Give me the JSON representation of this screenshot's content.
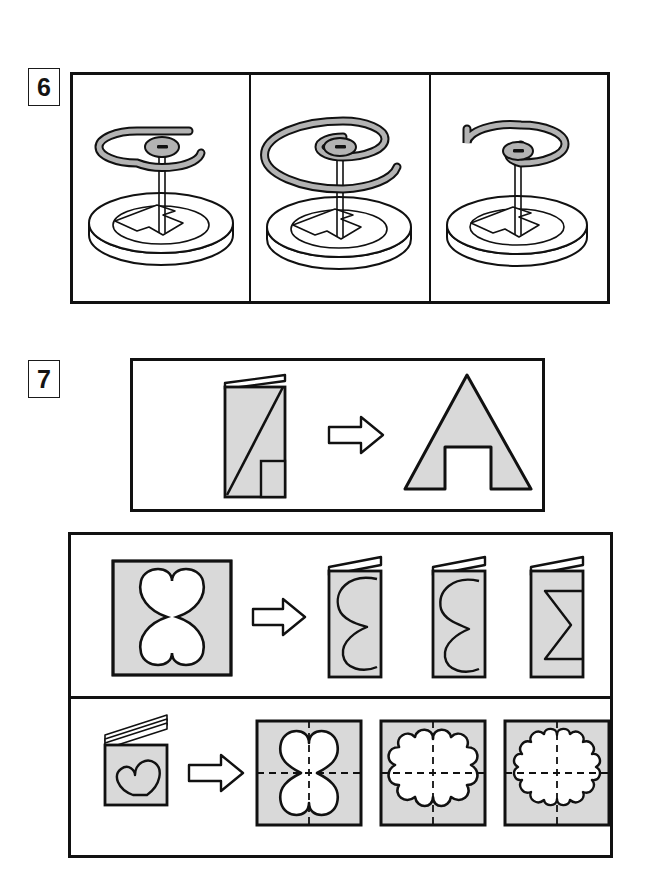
{
  "page": {
    "background_color": "#ffffff",
    "ink_color": "#111111",
    "fill_gray": "#d9d9d9",
    "coil_gray": "#b3b3b3"
  },
  "questions": [
    {
      "number": "6",
      "type": "pick-the-matching-coil",
      "description": "Three panels each showing a wire coil suspended above a round base plate with an arrow marking on it.",
      "panels": [
        {
          "id": "panel-1",
          "label": "A",
          "coil_turns": "1.25",
          "coil_size": "small",
          "coil_tail_direction": "right",
          "base": "round disc with arrow"
        },
        {
          "id": "panel-2",
          "label": "B",
          "coil_turns": "2.25",
          "coil_size": "large",
          "coil_tail_direction": "right-down",
          "base": "round disc with arrow"
        },
        {
          "id": "panel-3",
          "label": "C",
          "coil_turns": "1.75",
          "coil_size": "medium",
          "coil_tail_direction": "left-up",
          "base": "round disc with arrow"
        }
      ]
    },
    {
      "number": "7",
      "type": "paper-folding-and-cutting",
      "example": {
        "id": "example-row",
        "description": "Folded sheet with a diagonal cut and a small rectangular notch transforms into an A-shaped arch.",
        "input_label": "folded-sheet-with-diagonal-cut",
        "arrow": "right-arrow",
        "output_label": "arch-triangle-with-rectangular-notch"
      },
      "rows": [
        {
          "id": "row-butterfly",
          "description": "A square sheet with a four-petal butterfly hole, then three folded-sheet options.",
          "prompt_label": "square-with-four-petal-cutout",
          "arrow": "right-arrow",
          "options": [
            {
              "id": "option-1",
              "label": "folded-sheet-kidney-curve-a"
            },
            {
              "id": "option-2",
              "label": "folded-sheet-kidney-curve-b"
            },
            {
              "id": "option-3",
              "label": "folded-sheet-zigzag"
            }
          ]
        },
        {
          "id": "row-heart",
          "description": "A multi-fold booklet with a heart drawn on it, then three square results with dashed fold lines.",
          "prompt_label": "folded-booklet-with-heart",
          "arrow": "right-arrow",
          "options": [
            {
              "id": "option-1",
              "label": "square-with-4-petal-flower",
              "petals": "4"
            },
            {
              "id": "option-2",
              "label": "square-with-8-petal-flower",
              "petals": "8"
            },
            {
              "id": "option-3",
              "label": "square-with-12-petal-flower",
              "petals": "12"
            }
          ]
        }
      ]
    }
  ]
}
